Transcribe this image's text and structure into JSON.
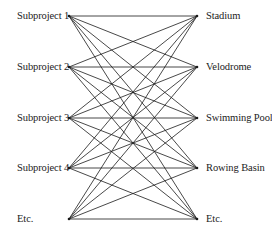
{
  "diagram": {
    "type": "complete-bipartite-graph",
    "left_nodes": [
      {
        "label": "Subproject 1"
      },
      {
        "label": "Subproject 2"
      },
      {
        "label": "Subproject 3"
      },
      {
        "label": "Subproject 4"
      },
      {
        "label": "Etc."
      }
    ],
    "right_nodes": [
      {
        "label": "Stadium"
      },
      {
        "label": "Velodrome"
      },
      {
        "label": "Swimming Pool"
      },
      {
        "label": "Rowing Basin"
      },
      {
        "label": "Etc."
      }
    ],
    "edges": "every left node connects to every right node",
    "line_color": "#1a1a1a"
  }
}
